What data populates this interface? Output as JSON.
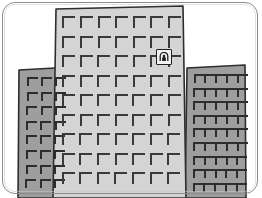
{
  "scene": {
    "title": "Office Buildings Illustration",
    "caption": "Three gray office towers with grid windows and a small sign",
    "width": 262,
    "height": 198,
    "background_color": "#ffffff",
    "frame": {
      "name": "rounded-panel-border",
      "stroke_color": "#8c8c8c",
      "corner_radius": 13
    }
  },
  "palette": {
    "center_building_fill": "#d4d4d4",
    "side_building_fill": "#9e9e9e",
    "outline_color": "#2e2e2e",
    "window_stroke": "#3a3a3a",
    "sign_background": "#f2f2f2",
    "sign_glyph": "#1f1f1f"
  },
  "buildings": [
    {
      "id": "left-building",
      "label": "Left low-rise tower",
      "fill": "#9e9e9e",
      "window_rows": 8,
      "window_cols": 3,
      "x": 18,
      "y": 68,
      "width": 56,
      "height": 130
    },
    {
      "id": "center-building",
      "label": "Center high-rise tower",
      "fill": "#d4d4d4",
      "window_rows": 9,
      "window_cols": 7,
      "x": 53,
      "y": 6,
      "width": 132,
      "height": 192
    },
    {
      "id": "right-building",
      "label": "Right low-rise tower",
      "fill": "#9e9e9e",
      "window_rows": 9,
      "window_cols": 5,
      "x": 186,
      "y": 66,
      "width": 60,
      "height": 132
    }
  ],
  "sign": {
    "id": "building-sign",
    "label": "Wall sign plaque",
    "glyph_name": "person-in-archway-icon",
    "x": 156,
    "y": 49,
    "size": 16
  }
}
